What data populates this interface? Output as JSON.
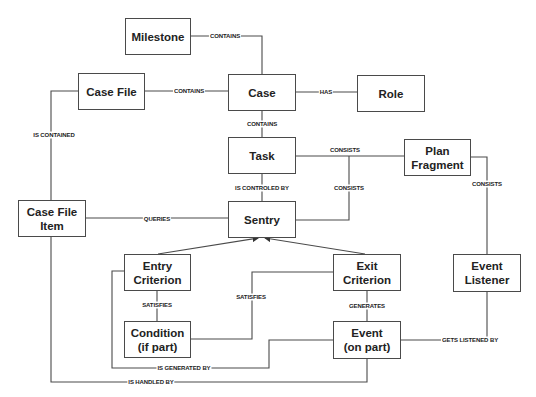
{
  "diagram": {
    "nodes": [
      {
        "id": "milestone",
        "label": "Milestone"
      },
      {
        "id": "case_file",
        "label": "Case File"
      },
      {
        "id": "case",
        "label": "Case"
      },
      {
        "id": "role",
        "label": "Role"
      },
      {
        "id": "task",
        "label": "Task"
      },
      {
        "id": "plan_fragment",
        "label": "Plan Fragment"
      },
      {
        "id": "case_file_item",
        "label": "Case File Item"
      },
      {
        "id": "sentry",
        "label": "Sentry"
      },
      {
        "id": "entry_criterion",
        "label": "Entry Criterion"
      },
      {
        "id": "exit_criterion",
        "label": "Exit Criterion"
      },
      {
        "id": "event_listener",
        "label": "Event Listener"
      },
      {
        "id": "condition",
        "label": "Condition (if part)"
      },
      {
        "id": "event",
        "label": "Event (on part)"
      }
    ],
    "edges": [
      {
        "from": "milestone",
        "to": "case",
        "label": "CONTAINS"
      },
      {
        "from": "case_file",
        "to": "case",
        "label": "CONTAINS"
      },
      {
        "from": "case",
        "to": "role",
        "label": "HAS"
      },
      {
        "from": "case",
        "to": "task",
        "label": "CONTAINS"
      },
      {
        "from": "task",
        "to": "plan_fragment",
        "label": "CONSISTS"
      },
      {
        "from": "task",
        "to": "sentry",
        "label": "IS CONTROLED BY"
      },
      {
        "from": "sentry",
        "to": "task",
        "label": "CONSISTS"
      },
      {
        "from": "plan_fragment",
        "to": "event_listener",
        "label": "CONSISTS"
      },
      {
        "from": "case_file",
        "to": "case_file_item",
        "label": "IS CONTAINED"
      },
      {
        "from": "case_file_item",
        "to": "sentry",
        "label": "QUERIES"
      },
      {
        "from": "entry_criterion",
        "to": "sentry",
        "label": ""
      },
      {
        "from": "exit_criterion",
        "to": "sentry",
        "label": ""
      },
      {
        "from": "entry_criterion",
        "to": "condition",
        "label": "SATISFIES"
      },
      {
        "from": "condition",
        "to": "exit_criterion",
        "label": "SATISFIES"
      },
      {
        "from": "exit_criterion",
        "to": "event",
        "label": "GENERATES"
      },
      {
        "from": "event",
        "to": "event_listener",
        "label": "GETS LISTENED BY"
      },
      {
        "from": "entry_criterion",
        "to": "event",
        "label": "IS GENERATED BY"
      },
      {
        "from": "case_file_item",
        "to": "event",
        "label": "IS HANDLED BY"
      }
    ]
  },
  "labels": {
    "milestone": "Milestone",
    "case_file": "Case File",
    "case": "Case",
    "role": "Role",
    "task": "Task",
    "plan_fragment_1": "Plan",
    "plan_fragment_2": "Fragment",
    "case_file_item_1": "Case File",
    "case_file_item_2": "Item",
    "sentry": "Sentry",
    "entry_criterion_1": "Entry",
    "entry_criterion_2": "Criterion",
    "exit_criterion_1": "Exit",
    "exit_criterion_2": "Criterion",
    "event_listener_1": "Event",
    "event_listener_2": "Listener",
    "condition_1": "Condition",
    "condition_2": "(if part)",
    "event_1": "Event",
    "event_2": "(on part)"
  },
  "edge_labels": {
    "milestone_case": "CONTAINS",
    "casefile_case": "CONTAINS",
    "case_role": "HAS",
    "case_task": "CONTAINS",
    "task_plan": "CONSISTS",
    "task_sentry": "IS CONTROLED BY",
    "sentry_consists": "CONSISTS",
    "plan_listener": "CONSISTS",
    "casefile_item": "IS CONTAINED",
    "item_sentry": "QUERIES",
    "entry_condition": "SATISFIES",
    "condition_exit": "SATISFIES",
    "exit_event": "GENERATES",
    "event_listener": "GETS LISTENED BY",
    "generated_by": "IS GENERATED BY",
    "handled_by": "IS HANDLED BY"
  },
  "colors": {
    "line": "#4a4a4a",
    "text": "#222222",
    "background": "#ffffff"
  }
}
